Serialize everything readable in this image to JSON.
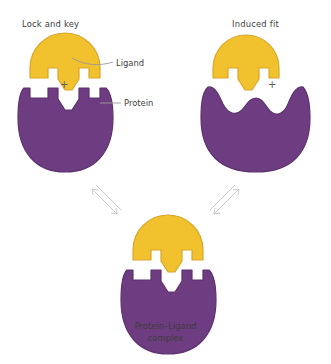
{
  "diagram": {
    "colors": {
      "ligand": "#F2C12E",
      "ligand_edge": "#D9A62A",
      "protein": "#6E3C80",
      "protein_edge": "#5E3370",
      "text": "#3d3d3d",
      "arrow": "#c9c9c9",
      "background": "#ffffff"
    },
    "panels": {
      "left": {
        "title": "Lock and key",
        "operator": "+",
        "ligand_name": "Ligand",
        "protein_name": "Protein",
        "binding_site": "pre-formed complementary notched site"
      },
      "right": {
        "title": "Induced fit",
        "operator": "+",
        "binding_site": "smooth undulating surface, reshapes on binding"
      },
      "bottom": {
        "caption_line1": "Protein–Ligand",
        "caption_line2": "complex"
      }
    },
    "arrows": {
      "left_label": "equilibrium double arrow",
      "right_label": "equilibrium double arrow"
    }
  }
}
